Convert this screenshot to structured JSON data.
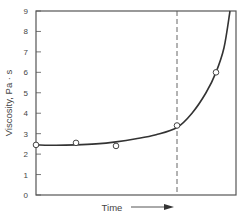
{
  "chart_data": {
    "type": "line",
    "title": "",
    "xlabel": "Time",
    "ylabel": "Viscosity, Pa · s",
    "ylim": [
      0,
      9
    ],
    "y_ticks": [
      0,
      1,
      2,
      3,
      4,
      5,
      6,
      7,
      8,
      9
    ],
    "x_ticks": [],
    "grid": false,
    "legend": null,
    "xlabel_arrow": true,
    "series": [
      {
        "name": "measured",
        "style": "markers-open-circle",
        "x": [
          0.0,
          0.2,
          0.4,
          0.705,
          0.9
        ],
        "y": [
          2.45,
          2.55,
          2.4,
          3.4,
          6.0
        ]
      },
      {
        "name": "fitted curve",
        "style": "solid-line",
        "x": [
          0.0,
          0.1,
          0.2,
          0.3,
          0.4,
          0.5,
          0.6,
          0.705,
          0.78,
          0.85,
          0.9,
          0.94,
          0.97
        ],
        "y": [
          2.45,
          2.43,
          2.45,
          2.5,
          2.6,
          2.75,
          2.95,
          3.3,
          4.0,
          5.0,
          6.0,
          7.2,
          9.0
        ]
      }
    ],
    "annotations": [
      {
        "type": "vertical-dashed-line",
        "x": 0.705
      }
    ],
    "colors": {
      "line": "#333333",
      "axis": "#555555",
      "marker_fill": "#ffffff",
      "marker_stroke": "#444444",
      "text": "#444444"
    }
  }
}
